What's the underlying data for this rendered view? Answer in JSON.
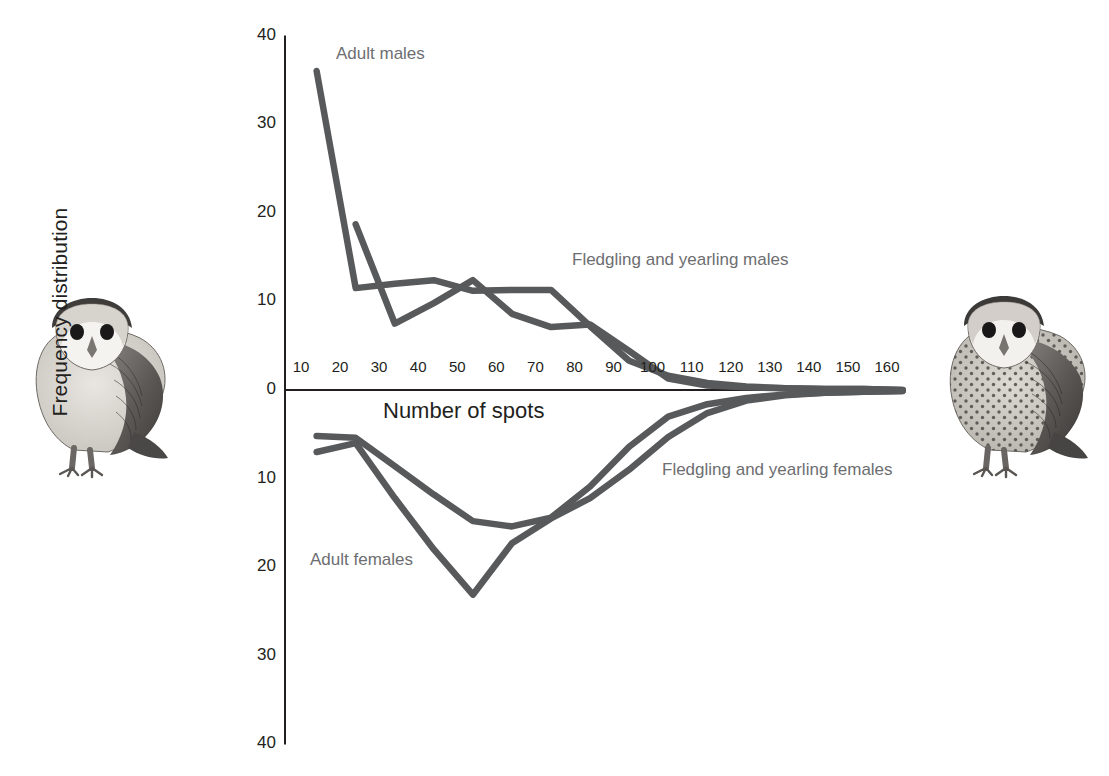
{
  "figure": {
    "axis_title_y": "Frequency distribution",
    "axis_title_x": "Number of spots",
    "labels": {
      "adult_males": "Adult males",
      "fledgling_yearling_males": "Fledgling and yearling males",
      "fledgling_yearling_females": "Fledgling and yearling females",
      "adult_females": "Adult females"
    },
    "illustrations": {
      "left": "barn-owl-male-unspotted-illustration",
      "right": "barn-owl-female-spotted-illustration"
    },
    "colors": {
      "line": "#58595b",
      "axis": "#231f20",
      "label_text": "#6d6e71",
      "tick_text": "#231f20",
      "background": "#ffffff"
    }
  },
  "chart_data": {
    "type": "line",
    "title": "",
    "xlabel": "Number of spots",
    "ylabel": "Frequency distribution",
    "xlim": [
      5,
      165
    ],
    "ylim": [
      -40,
      40
    ],
    "y_tick_labels": [
      "40",
      "30",
      "20",
      "10",
      "0",
      "10",
      "20",
      "30",
      "40"
    ],
    "y_tick_values": [
      40,
      30,
      20,
      10,
      0,
      -10,
      -20,
      -30,
      -40
    ],
    "x_tick_labels": [
      "10",
      "20",
      "30",
      "40",
      "50",
      "60",
      "70",
      "80",
      "90",
      "100",
      "110",
      "120",
      "130",
      "140",
      "150",
      "160"
    ],
    "x_tick_values": [
      10,
      20,
      30,
      40,
      50,
      60,
      70,
      80,
      90,
      100,
      110,
      120,
      130,
      140,
      150,
      160
    ],
    "grid": false,
    "legend": "inline-annotations",
    "note": "Males plotted upward (positive), females plotted downward (negative, axis labels unsigned)",
    "series": [
      {
        "name": "Adult males",
        "direction": "up",
        "x": [
          14,
          24,
          34,
          44,
          54,
          64,
          74,
          84,
          94,
          104,
          114,
          124,
          134,
          144,
          154,
          164
        ],
        "values": [
          36,
          11.5,
          12,
          12.4,
          11.2,
          11.3,
          11.3,
          7.2,
          3.3,
          1.6,
          0.8,
          0.4,
          0.2,
          0.1,
          0.1,
          0
        ]
      },
      {
        "name": "Fledgling and yearling males",
        "direction": "up",
        "x": [
          24,
          34,
          44,
          54,
          64,
          74,
          84,
          94,
          104,
          114,
          124,
          134,
          144,
          154,
          164
        ],
        "values": [
          18.7,
          7.5,
          9.8,
          12.4,
          8.6,
          7.1,
          7.4,
          4.4,
          1.3,
          0.5,
          0.3,
          0.2,
          0.1,
          0.1,
          0
        ]
      },
      {
        "name": "Fledgling and yearling females",
        "direction": "down",
        "x": [
          14,
          24,
          34,
          44,
          54,
          64,
          74,
          84,
          94,
          104,
          114,
          124,
          134,
          144,
          154,
          164
        ],
        "values": [
          -5.2,
          -5.4,
          -8.6,
          -11.8,
          -14.8,
          -15.4,
          -14.4,
          -10.9,
          -6.4,
          -3.0,
          -1.6,
          -0.9,
          -0.5,
          -0.3,
          -0.2,
          -0.1
        ]
      },
      {
        "name": "Adult females",
        "direction": "down",
        "x": [
          14,
          24,
          34,
          44,
          54,
          64,
          74,
          84,
          94,
          104,
          114,
          124,
          134,
          144,
          154,
          164
        ],
        "values": [
          -7.0,
          -6.0,
          -12.2,
          -18.0,
          -23.1,
          -17.3,
          -14.5,
          -12.2,
          -9.0,
          -5.3,
          -2.6,
          -1.2,
          -0.6,
          -0.3,
          -0.2,
          -0.1
        ]
      }
    ]
  }
}
